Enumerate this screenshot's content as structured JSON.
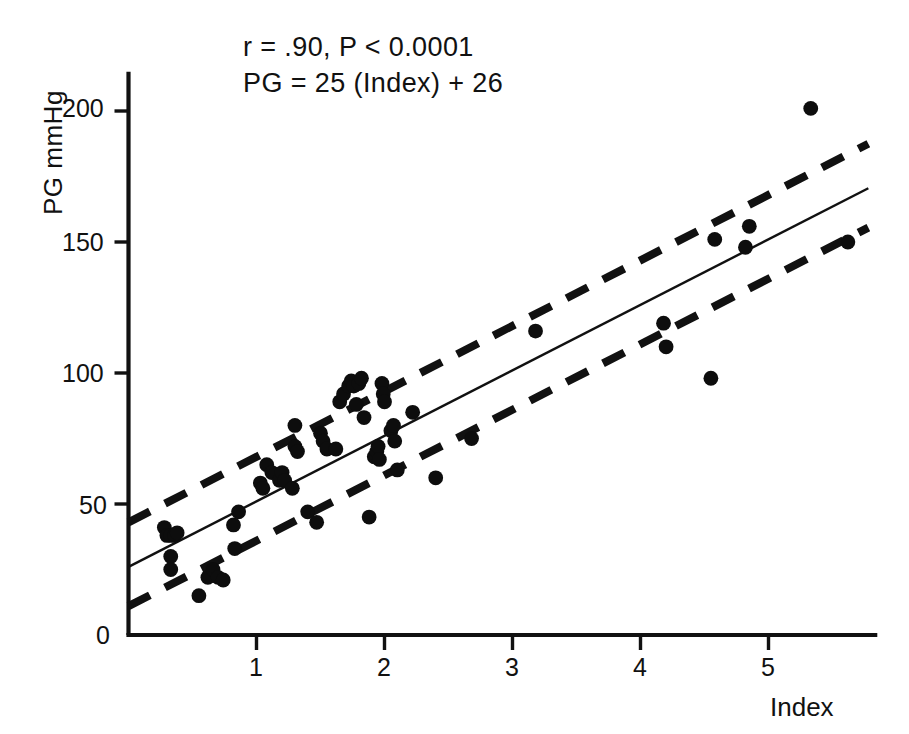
{
  "chart_data": {
    "type": "scatter",
    "title": "",
    "xlabel": "Index",
    "ylabel": "PG mmHg",
    "xlim": [
      0,
      5.85
    ],
    "ylim": [
      0,
      215
    ],
    "xticks": [
      "1",
      "2",
      "3",
      "4",
      "5"
    ],
    "xtick_values": [
      1,
      2,
      3,
      4,
      5
    ],
    "yticks": [
      "0",
      "50",
      "100",
      "150",
      "200"
    ],
    "ytick_values": [
      0,
      50,
      100,
      150,
      200
    ],
    "grid": false,
    "legend": "none",
    "annotations": [
      "r = .90, P < 0.0001",
      "PG = 25 (Index)  + 26"
    ],
    "statistics": {
      "r": 0.9,
      "p_value": "<0.0001",
      "regression_equation": "PG = 25 (Index) + 26",
      "slope": 25,
      "intercept": 26
    },
    "lines": [
      {
        "name": "regression-line",
        "style": "solid",
        "slope": 25,
        "intercept": 26,
        "x_start": 0.0,
        "x_end": 5.78
      },
      {
        "name": "upper-confidence-limit",
        "style": "dashed",
        "slope": 25,
        "intercept": 43,
        "x_start": 0.0,
        "x_end": 5.78
      },
      {
        "name": "lower-confidence-limit",
        "style": "dashed",
        "slope": 25,
        "intercept": 11,
        "x_start": 0.0,
        "x_end": 5.78
      }
    ],
    "points": [
      [
        0.28,
        41
      ],
      [
        0.3,
        38
      ],
      [
        0.33,
        38
      ],
      [
        0.36,
        38
      ],
      [
        0.38,
        39
      ],
      [
        0.33,
        30
      ],
      [
        0.33,
        25
      ],
      [
        0.55,
        15
      ],
      [
        0.62,
        22
      ],
      [
        0.66,
        25
      ],
      [
        0.7,
        22
      ],
      [
        0.74,
        21
      ],
      [
        0.82,
        42
      ],
      [
        0.83,
        33
      ],
      [
        0.86,
        47
      ],
      [
        1.03,
        58
      ],
      [
        1.05,
        56
      ],
      [
        1.08,
        65
      ],
      [
        1.12,
        62
      ],
      [
        1.18,
        59
      ],
      [
        1.2,
        62
      ],
      [
        1.22,
        59
      ],
      [
        1.28,
        56
      ],
      [
        1.3,
        80
      ],
      [
        1.3,
        72
      ],
      [
        1.32,
        70
      ],
      [
        1.4,
        47
      ],
      [
        1.47,
        43
      ],
      [
        1.5,
        77
      ],
      [
        1.52,
        74
      ],
      [
        1.55,
        71
      ],
      [
        1.62,
        71
      ],
      [
        1.65,
        89
      ],
      [
        1.68,
        92
      ],
      [
        1.72,
        95
      ],
      [
        1.74,
        97
      ],
      [
        1.76,
        95
      ],
      [
        1.78,
        88
      ],
      [
        1.8,
        96
      ],
      [
        1.82,
        98
      ],
      [
        1.84,
        83
      ],
      [
        1.88,
        45
      ],
      [
        1.92,
        68
      ],
      [
        1.94,
        70
      ],
      [
        1.95,
        72
      ],
      [
        1.96,
        67
      ],
      [
        1.98,
        96
      ],
      [
        1.99,
        92
      ],
      [
        2.0,
        89
      ],
      [
        2.05,
        78
      ],
      [
        2.07,
        80
      ],
      [
        2.08,
        74
      ],
      [
        2.1,
        63
      ],
      [
        2.22,
        85
      ],
      [
        2.4,
        60
      ],
      [
        2.68,
        75
      ],
      [
        3.18,
        116
      ],
      [
        4.18,
        119
      ],
      [
        4.2,
        110
      ],
      [
        4.55,
        98
      ],
      [
        4.58,
        151
      ],
      [
        4.82,
        148
      ],
      [
        4.85,
        156
      ],
      [
        5.33,
        201
      ],
      [
        5.62,
        150
      ]
    ],
    "point_count": 65
  },
  "axes": {
    "y_label": "PG mmHg",
    "x_label": "Index"
  }
}
